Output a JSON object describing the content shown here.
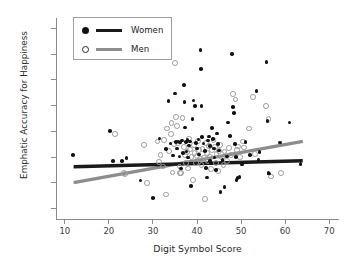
{
  "chart_data": {
    "type": "scatter",
    "title": "",
    "xlabel": "Digit Symbol Score",
    "ylabel": "Emphatic Accuracy for Happiness",
    "xlim": [
      8,
      72
    ],
    "ylim": [
      -0.28,
      1.28
    ],
    "xticks": [
      10,
      20,
      30,
      40,
      50,
      60,
      70
    ],
    "yticks": [
      -0.2,
      0.0,
      0.2,
      0.4,
      0.6,
      0.8,
      1.0,
      1.2
    ],
    "ytick_labels": [
      "−0.2",
      "0.0",
      "0.2",
      "0.4",
      "0.6",
      "0.8",
      "1.0",
      "1.2"
    ],
    "grid": false,
    "legend_position": "upper-left",
    "series": [
      {
        "name": "Women",
        "marker": "filled-circle",
        "color": "#111111",
        "line_color": "#1a1a1a",
        "fit": {
          "x0": 12,
          "y0": 0.125,
          "x1": 64,
          "y1": 0.172
        },
        "points": [
          [
            11.8,
            0.215
          ],
          [
            20.3,
            0.405
          ],
          [
            21.0,
            0.172
          ],
          [
            23.0,
            0.168
          ],
          [
            24.0,
            0.195
          ],
          [
            27.2,
            0.018
          ],
          [
            30.0,
            -0.115
          ],
          [
            31.5,
            0.345
          ],
          [
            33.0,
            0.262
          ],
          [
            33.5,
            0.637
          ],
          [
            34.0,
            0.305
          ],
          [
            34.5,
            0.212
          ],
          [
            35.0,
            0.695
          ],
          [
            35.2,
            0.318
          ],
          [
            35.5,
            0.268
          ],
          [
            35.8,
            0.322
          ],
          [
            36.0,
            0.205
          ],
          [
            36.2,
            0.315
          ],
          [
            36.4,
            0.112
          ],
          [
            36.6,
            0.33
          ],
          [
            36.8,
            0.232
          ],
          [
            37.0,
            0.76
          ],
          [
            37.2,
            0.627
          ],
          [
            37.3,
            0.43
          ],
          [
            37.5,
            0.318
          ],
          [
            37.6,
            0.243
          ],
          [
            37.8,
            0.333
          ],
          [
            38.0,
            0.198
          ],
          [
            38.2,
            0.292
          ],
          [
            38.4,
            0.32
          ],
          [
            38.6,
            -0.025
          ],
          [
            39.0,
            0.498
          ],
          [
            39.2,
            0.64
          ],
          [
            39.5,
            0.598
          ],
          [
            39.8,
            0.31
          ],
          [
            40.0,
            0.268
          ],
          [
            40.3,
            0.337
          ],
          [
            40.5,
            0.222
          ],
          [
            40.8,
            1.032
          ],
          [
            40.9,
            0.885
          ],
          [
            41.0,
            0.598
          ],
          [
            41.2,
            0.357
          ],
          [
            41.5,
            0.306
          ],
          [
            41.8,
            0.248
          ],
          [
            42.0,
            0.118
          ],
          [
            42.3,
            0.042
          ],
          [
            42.5,
            0.33
          ],
          [
            42.7,
            0.36
          ],
          [
            42.9,
            0.288
          ],
          [
            43.0,
            0.172
          ],
          [
            43.2,
            0.152
          ],
          [
            43.4,
            0.425
          ],
          [
            43.6,
            0.34
          ],
          [
            43.8,
            0.268
          ],
          [
            44.0,
            0.198
          ],
          [
            44.3,
            0.1
          ],
          [
            44.5,
            0.385
          ],
          [
            44.8,
            0.3
          ],
          [
            45.0,
            0.252
          ],
          [
            45.3,
            -0.07
          ],
          [
            45.8,
            0.178
          ],
          [
            46.2,
            -0.03
          ],
          [
            46.8,
            0.205
          ],
          [
            47.0,
            0.47
          ],
          [
            47.5,
            0.362
          ],
          [
            48.0,
            1.002
          ],
          [
            48.2,
            0.588
          ],
          [
            48.4,
            0.542
          ],
          [
            48.6,
            0.3
          ],
          [
            48.8,
            0.203
          ],
          [
            49.0,
            0.022
          ],
          [
            49.2,
            0.038
          ],
          [
            49.6,
            0.048
          ],
          [
            50.2,
            0.143
          ],
          [
            51.0,
            0.318
          ],
          [
            52.0,
            0.218
          ],
          [
            53.5,
            0.715
          ],
          [
            54.0,
            0.177
          ],
          [
            54.2,
            0.242
          ],
          [
            55.8,
            0.938
          ],
          [
            56.0,
            0.482
          ],
          [
            56.2,
            0.078
          ],
          [
            56.4,
            0.072
          ],
          [
            58.8,
            0.315
          ],
          [
            61.0,
            0.468
          ],
          [
            63.5,
            0.148
          ]
        ]
      },
      {
        "name": "Men",
        "marker": "open-circle",
        "color": "#9a9a9a",
        "line_color": "#8d8d8d",
        "fit": {
          "x0": 12,
          "y0": 0.002,
          "x1": 64,
          "y1": 0.322
        },
        "points": [
          [
            21.2,
            0.388
          ],
          [
            23.2,
            0.082
          ],
          [
            23.4,
            0.075
          ],
          [
            27.8,
            0.302
          ],
          [
            28.5,
            0.01
          ],
          [
            30.8,
            0.33
          ],
          [
            31.2,
            0.172
          ],
          [
            31.5,
            0.225
          ],
          [
            32.0,
            0.135
          ],
          [
            32.2,
            0.34
          ],
          [
            32.8,
            -0.082
          ],
          [
            33.0,
            0.43
          ],
          [
            33.5,
            0.258
          ],
          [
            33.8,
            0.385
          ],
          [
            34.0,
            0.472
          ],
          [
            34.2,
            0.088
          ],
          [
            34.5,
            0.312
          ],
          [
            34.8,
            0.94
          ],
          [
            35.0,
            0.522
          ],
          [
            35.2,
            0.45
          ],
          [
            35.5,
            0.318
          ],
          [
            35.8,
            0.135
          ],
          [
            36.0,
            0.085
          ],
          [
            36.2,
            0.082
          ],
          [
            36.5,
            0.512
          ],
          [
            36.8,
            0.288
          ],
          [
            37.0,
            0.222
          ],
          [
            37.2,
            0.162
          ],
          [
            37.5,
            0.248
          ],
          [
            37.8,
            0.12
          ],
          [
            38.0,
            0.352
          ],
          [
            38.2,
            0.268
          ],
          [
            38.5,
            0.212
          ],
          [
            38.8,
            0.03
          ],
          [
            39.0,
            0.305
          ],
          [
            39.2,
            0.238
          ],
          [
            39.5,
            0.16
          ],
          [
            39.8,
            0.218
          ],
          [
            40.0,
            0.332
          ],
          [
            40.2,
            0.262
          ],
          [
            40.5,
            0.192
          ],
          [
            40.8,
            0.148
          ],
          [
            41.0,
            0.272
          ],
          [
            41.3,
            0.205
          ],
          [
            41.5,
            -0.118
          ],
          [
            41.8,
            0.318
          ],
          [
            42.0,
            0.238
          ],
          [
            42.2,
            0.178
          ],
          [
            42.5,
            0.292
          ],
          [
            42.8,
            0.212
          ],
          [
            43.0,
            0.118
          ],
          [
            43.2,
            0.262
          ],
          [
            43.5,
            0.342
          ],
          [
            43.8,
            0.288
          ],
          [
            44.0,
            0.165
          ],
          [
            44.2,
            0.232
          ],
          [
            44.5,
            0.1
          ],
          [
            44.8,
            0.258
          ],
          [
            45.0,
            0.3
          ],
          [
            45.5,
            0.205
          ],
          [
            45.8,
            0.148
          ],
          [
            46.0,
            0.252
          ],
          [
            46.5,
            0.18
          ],
          [
            47.0,
            0.278
          ],
          [
            47.5,
            0.222
          ],
          [
            48.0,
            0.7
          ],
          [
            48.5,
            0.655
          ],
          [
            48.8,
            0.262
          ],
          [
            49.0,
            0.29
          ],
          [
            49.5,
            0.208
          ],
          [
            50.2,
            0.33
          ],
          [
            50.5,
            0.282
          ],
          [
            51.5,
            0.43
          ],
          [
            52.5,
            0.672
          ],
          [
            53.0,
            0.232
          ],
          [
            55.5,
            0.605
          ],
          [
            56.0,
            0.502
          ],
          [
            56.5,
            0.058
          ],
          [
            58.8,
            0.085
          ]
        ]
      }
    ]
  },
  "legend": {
    "items": [
      {
        "label": "Women",
        "marker": "filled-circle",
        "line": "black"
      },
      {
        "label": "Men",
        "marker": "open-circle",
        "line": "gray"
      }
    ]
  }
}
